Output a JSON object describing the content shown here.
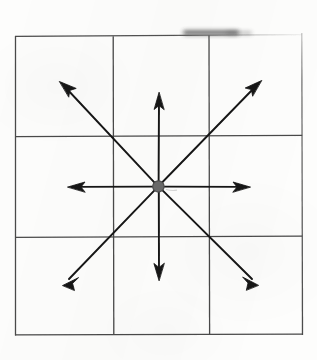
{
  "figure": {
    "title": "Eight-direction vector diagram",
    "medium": "scanned-paper-line-drawing",
    "canvas": {
      "width": 317,
      "height": 360
    },
    "colors": {
      "paper": "#fdfdfc",
      "grid_line": "#4a4a4a",
      "arrow": "#141414",
      "center_dot_fill": "#6b6b6b",
      "center_dot_stroke": "#4a4a4a",
      "smudge": "#3a3a3a"
    }
  },
  "grid": {
    "name": "three-by-three-grid",
    "rows": 3,
    "columns": 3,
    "bounds": {
      "x1": 15,
      "y1": 36,
      "x2": 302,
      "y2": 335
    },
    "vertical_lines_x": [
      15,
      113,
      209,
      302
    ],
    "horizontal_lines_y": [
      36,
      136,
      237,
      335
    ],
    "stroke_width": 1.3,
    "cells": [
      {
        "name": "cell-top-left",
        "row": 0,
        "col": 0
      },
      {
        "name": "cell-top-center",
        "row": 0,
        "col": 1
      },
      {
        "name": "cell-top-right",
        "row": 0,
        "col": 2
      },
      {
        "name": "cell-middle-left",
        "row": 1,
        "col": 0
      },
      {
        "name": "cell-middle-center",
        "row": 1,
        "col": 1
      },
      {
        "name": "cell-middle-right",
        "row": 1,
        "col": 2
      },
      {
        "name": "cell-bottom-left",
        "row": 2,
        "col": 0
      },
      {
        "name": "cell-bottom-center",
        "row": 2,
        "col": 1
      },
      {
        "name": "cell-bottom-right",
        "row": 2,
        "col": 2
      }
    ]
  },
  "center_dot": {
    "name": "center-dot",
    "cx": 158,
    "cy": 186,
    "r": 5.6,
    "fill": "#6b6b6b"
  },
  "arrows": [
    {
      "name": "arrow-north",
      "direction": "N",
      "angle_deg": 90,
      "tip": {
        "x": 159,
        "y": 93
      },
      "length_px": 93
    },
    {
      "name": "arrow-northeast",
      "direction": "NE",
      "angle_deg": 45,
      "tip": {
        "x": 261,
        "y": 81
      },
      "length_px": 146
    },
    {
      "name": "arrow-east",
      "direction": "E",
      "angle_deg": 0,
      "tip": {
        "x": 250,
        "y": 187
      },
      "length_px": 92
    },
    {
      "name": "arrow-southeast",
      "direction": "SE",
      "angle_deg": -45,
      "tip": {
        "x": 258,
        "y": 285
      },
      "length_px": 141
    },
    {
      "name": "arrow-south",
      "direction": "S",
      "angle_deg": -90,
      "tip": {
        "x": 159,
        "y": 280
      },
      "length_px": 94
    },
    {
      "name": "arrow-southwest",
      "direction": "SW",
      "angle_deg": -135,
      "tip": {
        "x": 63,
        "y": 285
      },
      "length_px": 138
    },
    {
      "name": "arrow-west",
      "direction": "W",
      "angle_deg": 180,
      "tip": {
        "x": 68,
        "y": 187
      },
      "length_px": 90
    },
    {
      "name": "arrow-northwest",
      "direction": "NW",
      "angle_deg": 135,
      "tip": {
        "x": 60,
        "y": 82
      },
      "length_px": 143
    }
  ],
  "artifacts": [
    {
      "name": "top-edge-smudge",
      "type": "scan-smudge",
      "x": 183,
      "y": 31,
      "width": 58,
      "height": 7,
      "note": "dark horizontal smear over the top grid edge"
    },
    {
      "name": "top-right-corner-fade",
      "type": "faded-line",
      "note": "top edge of the grid fades out toward the upper-right corner"
    }
  ]
}
